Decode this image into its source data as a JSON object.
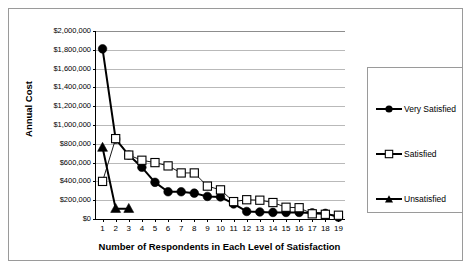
{
  "chart_data": {
    "type": "line",
    "title": "",
    "xlabel": "Number of Respondents in Each Level of Satisfaction",
    "ylabel": "Annual Cost",
    "x": [
      1,
      2,
      3,
      4,
      5,
      6,
      7,
      8,
      9,
      10,
      11,
      12,
      13,
      14,
      15,
      16,
      17,
      18,
      19
    ],
    "xtick_labels": [
      "1",
      "2",
      "3",
      "4",
      "5",
      "6",
      "7",
      "8",
      "9",
      "10",
      "11",
      "12",
      "13",
      "14",
      "15",
      "16",
      "17",
      "18",
      "19"
    ],
    "ylim": [
      0,
      2000000
    ],
    "ytick_values": [
      0,
      200000,
      400000,
      600000,
      800000,
      1000000,
      1200000,
      1400000,
      1600000,
      1800000,
      2000000
    ],
    "ytick_labels": [
      "$0",
      "$200,000",
      "$400,000",
      "$600,000",
      "$800,000",
      "$1,000,000",
      "$1,200,000",
      "$1,400,000",
      "$1,600,000",
      "$1,800,000",
      "$2,000,000"
    ],
    "grid": true,
    "legend_position": "right",
    "series": [
      {
        "name": "Very Satisfied",
        "marker": "filled-circle",
        "color": "#000000",
        "values": [
          1810000,
          850000,
          680000,
          550000,
          390000,
          290000,
          290000,
          275000,
          240000,
          235000,
          160000,
          80000,
          75000,
          70000,
          70000,
          70000,
          65000,
          60000,
          20000
        ]
      },
      {
        "name": "Satisfied",
        "marker": "open-square",
        "color": "#000000",
        "values": [
          400000,
          855000,
          680000,
          625000,
          600000,
          565000,
          490000,
          490000,
          350000,
          310000,
          185000,
          205000,
          200000,
          175000,
          125000,
          120000,
          55000,
          50000,
          40000
        ]
      },
      {
        "name": "Unsatisfied",
        "marker": "filled-triangle",
        "color": "#000000",
        "values": [
          760000,
          110000,
          110000,
          null,
          null,
          null,
          null,
          null,
          null,
          null,
          null,
          null,
          null,
          null,
          null,
          null,
          null,
          null,
          null
        ]
      }
    ]
  },
  "legend": {
    "items": [
      {
        "label": "Very Satisfied",
        "marker": "filled-circle"
      },
      {
        "label": "Satisfied",
        "marker": "open-square"
      },
      {
        "label": "Unsatisfied",
        "marker": "filled-triangle"
      }
    ]
  }
}
